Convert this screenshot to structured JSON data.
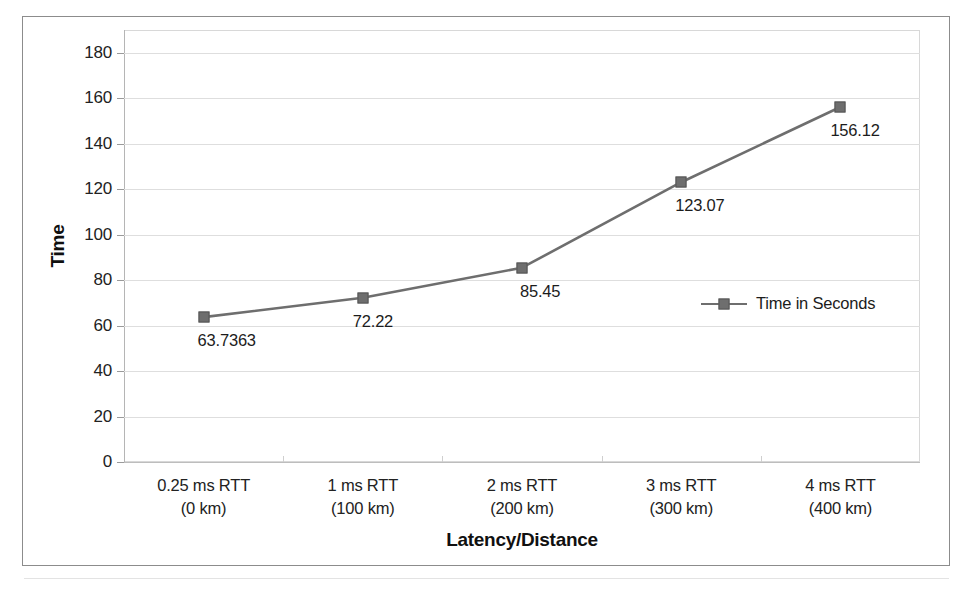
{
  "chart_data": {
    "type": "line",
    "title": "",
    "xlabel": "Latency/Distance",
    "ylabel": "Time",
    "categories": [
      "0.25 ms RTT\n(0 km)",
      "1 ms RTT\n(100 km)",
      "2 ms RTT\n(200 km)",
      "3 ms RTT\n(300 km)",
      "4 ms RTT\n(400 km)"
    ],
    "category_lines": [
      {
        "line1": "0.25 ms RTT",
        "line2": "(0 km)"
      },
      {
        "line1": "1 ms RTT",
        "line2": "(100 km)"
      },
      {
        "line1": "2 ms RTT",
        "line2": "(200 km)"
      },
      {
        "line1": "3 ms RTT",
        "line2": "(300 km)"
      },
      {
        "line1": "4 ms RTT",
        "line2": "(400 km)"
      }
    ],
    "series": [
      {
        "name": "Time in Seconds",
        "values": [
          63.7363,
          72.22,
          85.45,
          123.07,
          156.12
        ],
        "point_labels": [
          "63.7363",
          "72.22",
          "85.45",
          "123.07",
          "156.12"
        ],
        "color": "#6e6e6e",
        "marker": "square"
      }
    ],
    "ylim": [
      0,
      190
    ],
    "yticks": [
      0,
      20,
      40,
      60,
      80,
      100,
      120,
      140,
      160,
      180
    ],
    "ytick_labels": [
      "0",
      "20",
      "40",
      "60",
      "80",
      "100",
      "120",
      "140",
      "160",
      "180"
    ],
    "grid": true,
    "grid_axis": "y",
    "legend": {
      "position": "inside-right",
      "entries": [
        "Time in Seconds"
      ]
    }
  },
  "axes": {
    "y_title": "Time",
    "x_title": "Latency/Distance"
  },
  "colors": {
    "series": "#6e6e6e",
    "grid": "#dedede",
    "frame": "#8c8c8c",
    "text": "#1f1f1f"
  }
}
